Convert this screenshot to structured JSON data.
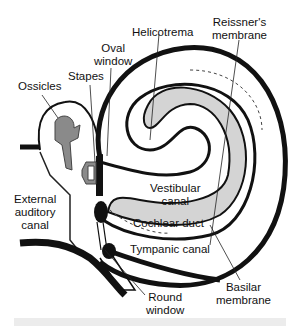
{
  "diagram": {
    "labels": {
      "helicotrema": "Helicotrema",
      "reissners_membrane": [
        "Reissner's",
        "membrane"
      ],
      "oval_window": [
        "Oval",
        "window"
      ],
      "stapes": "Stapes",
      "ossicles": "Ossicles",
      "external_auditory_canal": [
        "External",
        "auditory",
        "canal"
      ],
      "vestibular_canal": [
        "Vestibular",
        "canal"
      ],
      "cochlear_duct": "Cochlear duct",
      "tympanic_canal": "Tympanic canal",
      "round_window": [
        "Round",
        "window"
      ],
      "basilar_membrane": [
        "Basilar",
        "membrane"
      ]
    },
    "colors": {
      "outline": "#111111",
      "duct_fill": "#d4d4d4",
      "ossicle_fill": "#8a8a8a",
      "bottom_bar": "#ececec"
    }
  }
}
